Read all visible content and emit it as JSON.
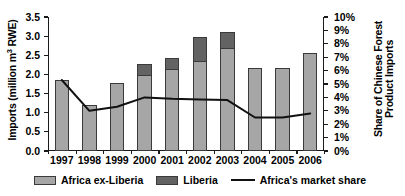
{
  "chart_data": {
    "type": "bar",
    "title": "",
    "subtitle": "",
    "categories": [
      "1997",
      "1998",
      "1999",
      "2000",
      "2001",
      "2002",
      "2003",
      "2004",
      "2005",
      "2006"
    ],
    "series": [
      {
        "name": "Africa ex-Liberia",
        "axis": "left",
        "color": "#a6a6a6",
        "values": [
          1.85,
          1.21,
          1.77,
          1.98,
          2.13,
          2.35,
          2.7,
          2.18,
          2.18,
          2.55
        ]
      },
      {
        "name": "Liberia",
        "axis": "left",
        "color": "#636363",
        "values": [
          0,
          0,
          0,
          0.3,
          0.31,
          0.63,
          0.4,
          0,
          0,
          0
        ]
      },
      {
        "name": "Africa's market share",
        "axis": "right",
        "type": "line",
        "color": "#111111",
        "values": [
          5.3,
          3.0,
          3.3,
          4.0,
          3.9,
          3.85,
          3.8,
          2.5,
          2.5,
          2.8
        ]
      }
    ],
    "stacked": true,
    "ylabel": "Imports (million m3 RWE)",
    "ylabel_parts": {
      "pre": "Imports (million m",
      "sup": "3",
      "post": " RWE)"
    },
    "ylabel_right": "Share of Chinese Forest Product Imports",
    "xlabel": "",
    "ylim": [
      0,
      3.5
    ],
    "ylim_right": [
      0,
      10
    ],
    "ytick_labels": [
      "3.5",
      "3.0",
      "2.5",
      "2.0",
      "1.5",
      "1.0",
      "0.5",
      "0.0"
    ],
    "ytick_values": [
      3.5,
      3.0,
      2.5,
      2.0,
      1.5,
      1.0,
      0.5,
      0.0
    ],
    "ytick_labels_right": [
      "10%",
      "9%",
      "8%",
      "7%",
      "6%",
      "5%",
      "4%",
      "3%",
      "2%",
      "1%",
      "0%"
    ],
    "ytick_values_right": [
      10,
      9,
      8,
      7,
      6,
      5,
      4,
      3,
      2,
      1,
      0
    ],
    "grid": false,
    "legend_position": "bottom",
    "legend": [
      {
        "label": "Africa ex-Liberia",
        "marker": "swatch-light-gray"
      },
      {
        "label": "Liberia",
        "marker": "swatch-dark-gray"
      },
      {
        "label": "Africa's market share",
        "marker": "line-black"
      }
    ]
  }
}
